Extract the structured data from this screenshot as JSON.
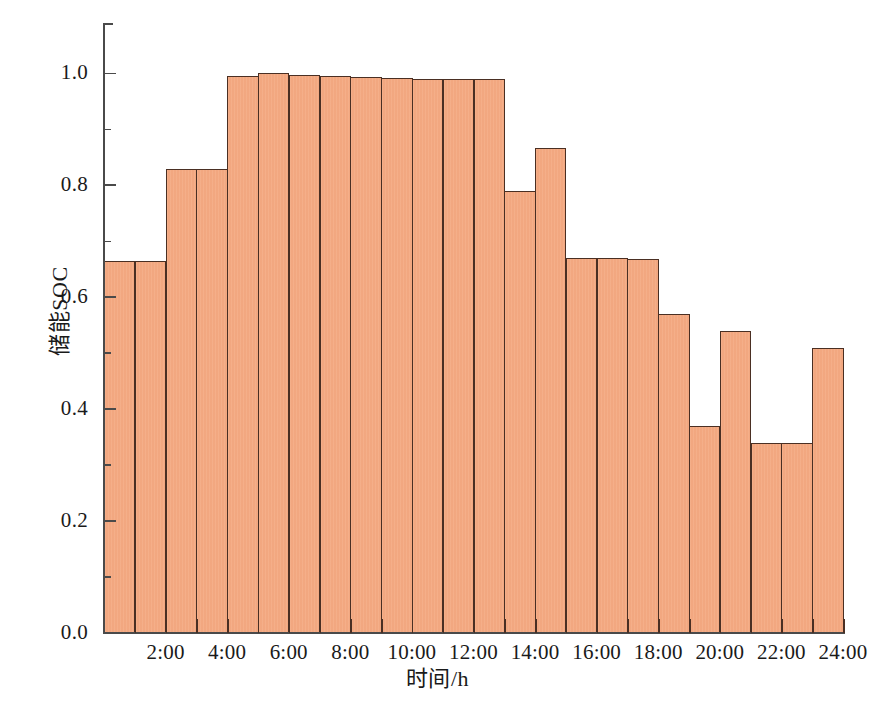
{
  "chart_data": {
    "type": "bar",
    "title": "",
    "xlabel": "时间/h",
    "ylabel": "储能SOC",
    "xlim": [
      0,
      24
    ],
    "ylim": [
      0.0,
      1.09
    ],
    "grid": false,
    "legend": null,
    "bar_fill_color": "#F4A981",
    "bar_edge_color": "#4A2F23",
    "axis_color": "#4A4A4A",
    "categories": [
      "1:00",
      "2:00",
      "3:00",
      "4:00",
      "5:00",
      "6:00",
      "7:00",
      "8:00",
      "9:00",
      "10:00",
      "11:00",
      "12:00",
      "13:00",
      "14:00",
      "15:00",
      "16:00",
      "17:00",
      "18:00",
      "19:00",
      "20:00",
      "21:00",
      "22:00",
      "23:00",
      "24:00"
    ],
    "values": [
      0.665,
      0.665,
      0.83,
      0.83,
      0.995,
      1.0,
      0.998,
      0.995,
      0.993,
      0.992,
      0.99,
      0.99,
      0.99,
      0.79,
      0.866,
      0.67,
      0.67,
      0.668,
      0.57,
      0.37,
      0.54,
      0.34,
      0.34,
      0.51
    ],
    "x_tick_labels": [
      "2:00",
      "4:00",
      "6:00",
      "8:00",
      "10:00",
      "12:00",
      "14:00",
      "16:00",
      "18:00",
      "20:00",
      "22:00",
      "24:00"
    ],
    "x_tick_values": [
      2,
      4,
      6,
      8,
      10,
      12,
      14,
      16,
      18,
      20,
      22,
      24
    ],
    "x_minor_tick_values": [
      1,
      3,
      5,
      7,
      9,
      11,
      13,
      15,
      17,
      19,
      21,
      23
    ],
    "y_tick_labels": [
      "0.0",
      "0.2",
      "0.4",
      "0.6",
      "0.8",
      "1.0"
    ],
    "y_tick_values": [
      0.0,
      0.2,
      0.4,
      0.6,
      0.8,
      1.0
    ],
    "y_minor_tick_values": [
      0.1,
      0.3,
      0.5,
      0.7,
      0.9
    ]
  },
  "caption": {
    "text": ""
  }
}
